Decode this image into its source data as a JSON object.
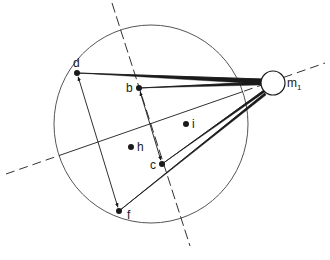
{
  "diagram": {
    "colors": {
      "ink": "#1a1a1a",
      "outline": "#555555",
      "background": "#ffffff"
    },
    "main_circle": {
      "cx": 151,
      "cy": 124,
      "rx": 97,
      "ry": 99
    },
    "mass": {
      "label": "m",
      "subscript": "1",
      "cx": 273,
      "cy": 83,
      "r": 12
    },
    "points": [
      {
        "id": "d",
        "label": "d",
        "x": 77,
        "y": 73,
        "lx": 73,
        "ly": 67
      },
      {
        "id": "b",
        "label": "b",
        "x": 139,
        "y": 88,
        "lx": 126,
        "ly": 92
      },
      {
        "id": "i",
        "label": "i",
        "x": 186,
        "y": 124,
        "lx": 192,
        "ly": 128
      },
      {
        "id": "h",
        "label": "h",
        "x": 131,
        "y": 147,
        "lx": 137,
        "ly": 151
      },
      {
        "id": "c",
        "label": "c",
        "x": 162,
        "y": 164,
        "lx": 150,
        "ly": 169
      },
      {
        "id": "f",
        "label": "f",
        "x": 119,
        "y": 211,
        "lx": 127,
        "ly": 219
      }
    ],
    "axes": [
      {
        "name": "steep-axis",
        "x1": 112,
        "y1": 3,
        "x2": 190,
        "y2": 246
      },
      {
        "name": "shallow-axis",
        "x1": 6,
        "y1": 174,
        "x2": 325,
        "y2": 63
      }
    ],
    "double_arrows": [
      {
        "from": "d",
        "to": "f"
      },
      {
        "from": "b",
        "to": "c"
      }
    ],
    "wedges": [
      {
        "from": "d",
        "tip1": [
          262,
          79
        ],
        "tip2": [
          262,
          84
        ]
      },
      {
        "from": "b",
        "tip1": [
          261,
          82
        ],
        "tip2": [
          261,
          85
        ]
      },
      {
        "from": "c",
        "tip1": [
          264,
          90
        ],
        "tip2": [
          265,
          92
        ]
      },
      {
        "from": "f",
        "tip1": [
          265,
          93
        ],
        "tip2": [
          266,
          95
        ]
      }
    ]
  }
}
